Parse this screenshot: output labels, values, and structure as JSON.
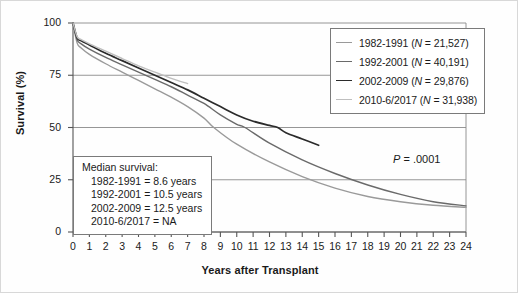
{
  "chart_data": {
    "type": "line",
    "title": "",
    "xlabel": "Years after Transplant",
    "ylabel": "Survival (%)",
    "xlim": [
      0,
      24
    ],
    "ylim": [
      0,
      100
    ],
    "xticks": [
      0,
      1,
      2,
      3,
      4,
      5,
      6,
      7,
      8,
      9,
      10,
      11,
      12,
      13,
      14,
      15,
      16,
      17,
      18,
      19,
      20,
      21,
      22,
      23,
      24
    ],
    "yticks": [
      0,
      25,
      50,
      75,
      100
    ],
    "grid": "horizontal",
    "legend_position": "top-right",
    "annotation_pvalue": "P = .0001",
    "series": [
      {
        "name": "1982-1991",
        "legend_label": "1982-1991 (N = 21,527)",
        "n": "21,527",
        "color": "#9a9a9a",
        "median_survival": "8.6 years",
        "x": [
          0,
          0.25,
          0.5,
          1,
          2,
          3,
          4,
          5,
          6,
          7,
          8,
          8.6,
          10,
          12,
          14,
          16,
          18,
          20,
          22,
          24
        ],
        "y": [
          100,
          90.5,
          88.0,
          85.0,
          80.5,
          76.5,
          72.5,
          68.5,
          64.5,
          60.0,
          54.5,
          50.0,
          42.0,
          33.5,
          26.5,
          21.0,
          17.0,
          14.5,
          12.8,
          11.8
        ]
      },
      {
        "name": "1992-2001",
        "legend_label": "1992-2001 (N = 40,191)",
        "n": "40,191",
        "color": "#6a6a6a",
        "median_survival": "10.5 years",
        "x": [
          0,
          0.25,
          0.5,
          1,
          2,
          3,
          4,
          5,
          6,
          7,
          8,
          9,
          10,
          10.5,
          12,
          14,
          16,
          18,
          20,
          22,
          24
        ],
        "y": [
          100,
          92.0,
          90.0,
          87.5,
          83.5,
          80.0,
          76.5,
          73.0,
          69.5,
          65.5,
          61.5,
          56.0,
          51.5,
          50.0,
          42.5,
          34.5,
          28.0,
          22.5,
          18.0,
          14.5,
          12.5
        ]
      },
      {
        "name": "2002-2009",
        "legend_label": "2002-2009 (N = 29,876)",
        "n": "29,876",
        "color": "#2b2b2b",
        "median_survival": "12.5 years",
        "x": [
          0,
          0.25,
          0.5,
          1,
          2,
          3,
          4,
          5,
          6,
          7,
          8,
          9,
          10,
          11,
          12,
          12.5,
          13,
          14,
          15
        ],
        "y": [
          100,
          93.0,
          91.5,
          89.5,
          85.5,
          82.0,
          78.5,
          75.0,
          71.5,
          68.0,
          64.0,
          60.0,
          56.0,
          53.0,
          51.0,
          50.0,
          47.5,
          44.5,
          41.5
        ]
      },
      {
        "name": "2010-6/2017",
        "legend_label": "2010-6/2017 (N = 31,938)",
        "n": "31,938",
        "color": "#bfbfbf",
        "median_survival": "NA",
        "x": [
          0,
          0.25,
          0.5,
          1,
          2,
          3,
          4,
          5,
          6,
          7
        ],
        "y": [
          100,
          93.5,
          92.0,
          90.0,
          86.5,
          83.0,
          79.5,
          76.5,
          73.5,
          71.0
        ]
      }
    ]
  },
  "legend": {
    "items": [
      {
        "label": "1982-1991 (",
        "n_prefix": "N",
        "n_text": " = 21,527)",
        "color": "#9a9a9a"
      },
      {
        "label": "1992-2001 (",
        "n_prefix": "N",
        "n_text": " = 40,191)",
        "color": "#6a6a6a"
      },
      {
        "label": "2002-2009 (",
        "n_prefix": "N",
        "n_text": " = 29,876)",
        "color": "#2b2b2b"
      },
      {
        "label": "2010-6/2017 (",
        "n_prefix": "N",
        "n_text": " = 31,938)",
        "color": "#bfbfbf"
      }
    ]
  },
  "median_box": {
    "title": "Median survival:",
    "lines": [
      "1982-1991 = 8.6 years",
      "1992-2001 = 10.5 years",
      "2002-2009 = 12.5 years",
      "2010-6/2017 = NA"
    ]
  },
  "annotations": {
    "pvalue_italic": "P",
    "pvalue_rest": " = .0001"
  },
  "axes": {
    "y_title": "Survival (%)",
    "x_title": "Years after Transplant",
    "y_tick_labels": [
      "100",
      "75",
      "50",
      "25",
      "0"
    ],
    "x_tick_labels": [
      "0",
      "1",
      "2",
      "3",
      "4",
      "5",
      "6",
      "7",
      "8",
      "9",
      "10",
      "11",
      "12",
      "13",
      "14",
      "15",
      "16",
      "17",
      "18",
      "19",
      "20",
      "21",
      "22",
      "23",
      "24"
    ]
  },
  "colors": {
    "axis": "#555555",
    "grid": "#8a8a8a",
    "frame": "#d8d8d8",
    "box_border": "#7a7a7a",
    "text": "#1a1a1a"
  }
}
